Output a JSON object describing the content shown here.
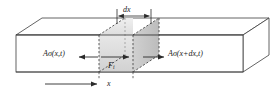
{
  "figure": {
    "background_color": "#ffffff",
    "line_color": "#3c3c3c",
    "dashed_color": "#4a4a4a",
    "shade_front_color": "#d8d8d8",
    "shade_top_color": "#e8e8e8",
    "shade_side_color": "#bdbdbd",
    "labels": {
      "dx": "dx",
      "stress_left": "Aσ(x,t)",
      "stress_right": "Aσ(x+dx,t)",
      "force": "F",
      "force_subscript": "i",
      "position": "x"
    },
    "icons": {
      "arrow_left": "arrow-left-icon",
      "arrow_right": "arrow-right-icon",
      "dimension_line": "dimension-line-icon"
    },
    "geometry": {
      "bar_front_left_x": 16,
      "bar_front_right_x": 243,
      "bar_front_top_y": 35,
      "bar_front_bottom_y": 72,
      "depth_dx": 26,
      "depth_dy": -17,
      "element_left_x": 99,
      "element_right_x": 133
    }
  }
}
